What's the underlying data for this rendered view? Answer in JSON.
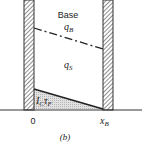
{
  "diagram": {
    "region_label": "Base",
    "upper_line_label": "q",
    "upper_line_sub": "B",
    "middle_label": "q",
    "middle_sub": "S",
    "shaded_label_main": "I",
    "shaded_label_sub1": "C",
    "shaded_label_tau": "τ",
    "shaded_label_sub2": "F",
    "x_origin_label": "0",
    "x_end_label": "x",
    "x_end_sub": "B",
    "caption": "(b)"
  }
}
